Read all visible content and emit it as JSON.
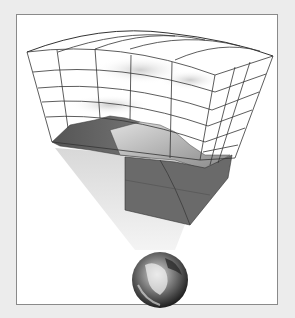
{
  "figure": {
    "colors": {
      "background": "#ececec",
      "frame_fill": "#ffffff",
      "frame_border": "#8a8a8a",
      "grid_line": "#333333",
      "terrain_dark": "#5e5e5e",
      "terrain_light": "#bdbdbd",
      "beam": "#e6e6e6"
    }
  }
}
